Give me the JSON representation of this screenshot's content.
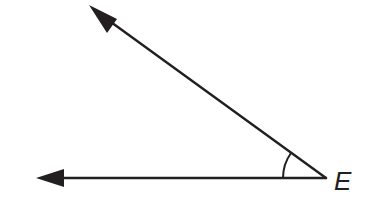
{
  "diagram": {
    "type": "angle",
    "vertex_label": "E",
    "vertex": {
      "x": 326,
      "y": 178
    },
    "rays": [
      {
        "name": "ray-upper-left",
        "tip": {
          "x": 89,
          "y": 5
        }
      },
      {
        "name": "ray-left",
        "tip": {
          "x": 36,
          "y": 178
        }
      }
    ],
    "angle_arc": {
      "radius": 43
    },
    "colors": {
      "stroke": "#231f20",
      "background": "#ffffff"
    }
  }
}
